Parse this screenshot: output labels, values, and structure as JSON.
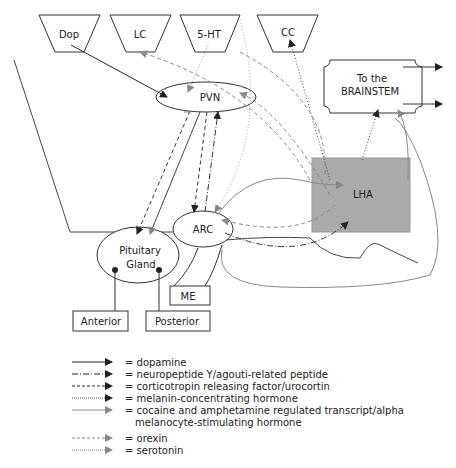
{
  "nodes": {
    "dop": "Dop",
    "lc": "LC",
    "ht5": "5-HT",
    "cc": "CC",
    "brainstem_line1": "To the",
    "brainstem_line2": "BRAINSTEM",
    "pvn": "PVN",
    "lha": "LHA",
    "arc": "ARC",
    "pituitary_line1": "Pituitary",
    "pituitary_line2": "Gland",
    "me": "ME",
    "anterior": "Anterior",
    "posterior": "Posterior"
  },
  "colors": {
    "dark": "#222222",
    "gray": "#777777",
    "light_gray": "#999999",
    "lha_fill": "#aaaaaa"
  },
  "legend": [
    {
      "style": "solid-dark",
      "label": "= dopamine"
    },
    {
      "style": "dashdot-dark",
      "label": "= neuropeptide Y/agouti-related peptide"
    },
    {
      "style": "dashed-dark",
      "label": "= corticotropin releasing factor/urocortin"
    },
    {
      "style": "dotted-dark",
      "label": "= melanin-concentrating hormone"
    },
    {
      "style": "solid-gray",
      "label": "= cocaine and amphetamine regulated transcript/alpha",
      "label2": "melanocyte-stimulating hormone"
    },
    {
      "style": "dashed-gray",
      "label": "= orexin"
    },
    {
      "style": "dotted-gray",
      "label": "= serotonin"
    }
  ]
}
